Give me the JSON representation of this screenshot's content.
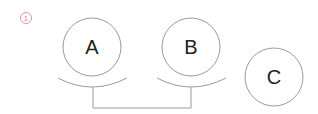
{
  "diagram": {
    "step_marker": {
      "label": "1",
      "color": "#e38a97"
    },
    "nodes": [
      {
        "id": "A",
        "label": "A"
      },
      {
        "id": "B",
        "label": "B"
      },
      {
        "id": "C",
        "label": "C"
      }
    ],
    "connections": [
      {
        "from": "A",
        "to": "B",
        "style": "bracket"
      }
    ],
    "stroke_color": "#9a9a9a",
    "text_color": "#222222"
  }
}
